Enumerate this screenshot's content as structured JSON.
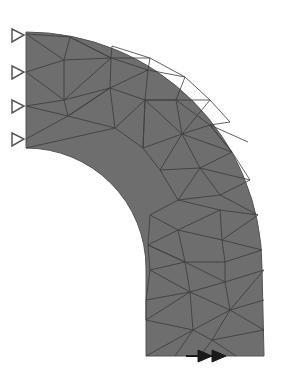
{
  "diagram": {
    "title": "Finite element mesh of curved beam (quarter annulus with straight leg)",
    "body_fill": "#6e6e6e",
    "mesh_line_color": "#3a3a3a",
    "support_color": "#555555",
    "load_color": "#1a1a1a",
    "supports": {
      "type": "pin-triangle",
      "count": 4,
      "side": "left",
      "y_positions": [
        35,
        72,
        106,
        139
      ]
    },
    "load": {
      "type": "double-arrow",
      "direction": "right",
      "location": "bottom edge",
      "x": 190,
      "y": 356
    },
    "geometry": {
      "arc_center": [
        26,
        268
      ],
      "inner_radius": 120,
      "outer_radius": 236,
      "straight_leg_bottom_y": 356
    }
  }
}
